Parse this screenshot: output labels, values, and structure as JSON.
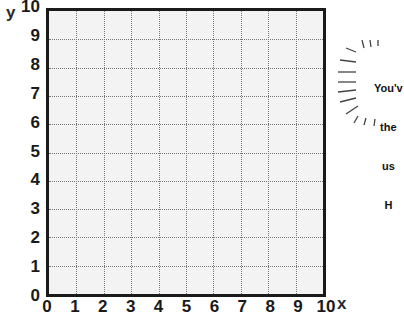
{
  "chart_data": {
    "type": "scatter",
    "title": "",
    "xlabel": "x",
    "ylabel": "y",
    "xlim": [
      0,
      10
    ],
    "ylim": [
      0,
      10
    ],
    "grid": true,
    "grid_style": "dotted",
    "x_ticks": [
      "0",
      "1",
      "2",
      "3",
      "4",
      "5",
      "6",
      "7",
      "8",
      "9",
      "10"
    ],
    "y_ticks": [
      "0",
      "1",
      "2",
      "3",
      "4",
      "5",
      "6",
      "7",
      "8",
      "9",
      "10"
    ],
    "series": []
  },
  "axes": {
    "x_label": "x",
    "y_label": "y"
  },
  "callout": {
    "lines": [
      "You'v",
      "the",
      "us",
      "H"
    ]
  },
  "colors": {
    "grid_background": "#f3f3f3",
    "axis": "#1a1a1a",
    "gridline": "#777777"
  }
}
